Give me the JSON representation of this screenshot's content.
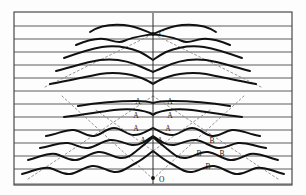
{
  "figure": {
    "type": "wave-record-section",
    "frame": {
      "x": 14,
      "y": 12,
      "width": 278,
      "height": 173,
      "stroke": "#3a3a3a",
      "stroke_width": 1.1
    },
    "axis": {
      "centerline_x": 153,
      "centerline_top_y": 13,
      "centerline_bottom_y": 184,
      "stroke": "#2b2b2b",
      "stroke_width": 1.0
    },
    "point_labels": [
      {
        "name": "C",
        "text": "C",
        "x": 159,
        "y": 36,
        "dot_x": 153,
        "dot_y": 34,
        "dot_r": 1.9
      },
      {
        "name": "O",
        "text": "O",
        "x": 159,
        "y": 182,
        "dot_x": 153,
        "dot_y": 178,
        "dot_r": 1.9
      }
    ],
    "baselines": {
      "count": 13,
      "stroke": "#4a4a4a",
      "stroke_width": 0.9,
      "y_values": [
        26,
        39,
        52,
        65,
        78,
        91,
        104,
        117,
        130,
        143,
        156,
        169,
        184
      ]
    },
    "traces": {
      "stroke": "#111111",
      "stroke_width": 2.0,
      "paths": [
        "M 90 32 C 100 25, 112 24, 124 25 C 136 26, 145 31, 153 34 C 161 31, 170 26, 182 25 C 194 24, 206 25, 216 32",
        "M 76 45 C 88 40, 96 38, 104 39 C 112 40, 118 44, 124 41 C 132 37, 142 36, 153 34 C 164 36, 174 37, 182 41 C 188 44, 194 40, 202 39 C 210 38, 218 40, 230 45",
        "M 64 58 C 78 53, 90 49, 102 47 C 116 45, 128 47, 140 52 C 146 55, 150 58, 153 60 C 156 58, 160 55, 166 52 C 178 47, 190 45, 204 47 C 216 49, 228 53, 242 58",
        "M 56 71 C 72 67, 86 62, 100 60 C 116 58, 132 62, 144 68 C 148 70, 151 71, 153 72 C 155 71, 158 70, 162 68 C 174 62, 190 58, 206 60 C 220 62, 234 67, 250 71",
        "M 50 84 C 68 81, 84 77, 100 74 C 118 71, 136 75, 146 80 C 150 82, 152 83, 153 84 C 154 83, 156 82, 160 80 C 170 75, 188 71, 206 74 C 222 77, 238 81, 256 84",
        "M 64 117 C 82 115, 98 112, 114 110 C 130 108, 142 110, 150 113 C 152 114, 153 115, 153 115 C 153 115, 154 114, 156 113 C 164 110, 176 108, 192 110 C 208 112, 224 115, 242 117",
        "M 46 136 C 58 134, 66 129, 74 130 C 82 131, 86 137, 94 136 C 102 135, 106 128, 114 128 C 122 128, 126 135, 134 135 C 142 135, 148 130, 153 128 C 158 130, 164 135, 172 135 C 180 135, 184 128, 192 128 C 200 128, 204 135, 212 136 C 220 137, 224 131, 232 130 C 240 129, 248 134, 260 136",
        "M 40 148 C 52 146, 60 142, 68 143 C 76 144, 80 149, 88 148 C 96 147, 102 141, 110 140 C 118 139, 124 144, 132 145 C 140 146, 147 140, 153 136 C 159 140, 166 146, 174 145 C 182 144, 188 139, 196 140 C 204 141, 210 147, 218 148 C 226 149, 230 144, 238 143 C 246 142, 254 146, 266 148",
        "M 28 160 C 40 157, 48 152, 56 154 C 64 156, 68 161, 76 160 C 84 159, 90 153, 98 152 C 106 151, 112 157, 120 158 C 128 159, 134 153, 140 148 C 145 144, 150 140, 153 137 C 156 140, 161 144, 166 148 C 172 153, 178 159, 186 158 C 194 157, 200 151, 208 152 C 216 153, 222 159, 230 160 C 238 161, 242 156, 250 154 C 258 152, 266 157, 278 160",
        "M 22 174 C 34 171, 42 166, 50 168 C 58 170, 62 175, 70 174 C 78 173, 84 167, 92 166 C 100 165, 106 171, 114 172 C 122 173, 128 167, 136 163 C 142 160, 148 155, 153 151 C 158 155, 164 160, 170 163 C 178 167, 184 173, 192 172 C 200 171, 206 165, 214 166 C 222 167, 228 173, 236 174 C 244 175, 248 170, 256 168 C 264 166, 272 171, 284 174"
      ],
      "short_trace": "M 78 106 C 96 103, 116 101, 136 101 C 146 101, 150 102, 153 103 C 156 102, 162 101, 172 101 C 192 101, 212 103, 230 106"
    },
    "dashed_lines": {
      "stroke": "#8a8a8a",
      "stroke_width": 0.9,
      "dash_pattern": "2,2.5",
      "segments": [
        {
          "name": "left-upper-diagonal",
          "x1": 45,
          "y1": 87,
          "x2": 153,
          "y2": 34
        },
        {
          "name": "right-upper-diagonal",
          "x1": 261,
          "y1": 87,
          "x2": 153,
          "y2": 34
        },
        {
          "name": "left-lower-diagonal",
          "x1": 28,
          "y1": 179,
          "x2": 153,
          "y2": 96
        },
        {
          "name": "right-lower-diagonal",
          "x1": 278,
          "y1": 179,
          "x2": 153,
          "y2": 96
        },
        {
          "name": "left-cross-diagonal",
          "x1": 62,
          "y1": 96,
          "x2": 153,
          "y2": 179
        },
        {
          "name": "right-cross-diagonal",
          "x1": 244,
          "y1": 96,
          "x2": 153,
          "y2": 179
        },
        {
          "name": "left-inner-cross",
          "x1": 96,
          "y1": 110,
          "x2": 153,
          "y2": 151
        },
        {
          "name": "right-inner-cross",
          "x1": 210,
          "y1": 110,
          "x2": 153,
          "y2": 151
        }
      ]
    },
    "phase_labels": {
      "font_size": 7.5,
      "color": "#1a1a1a",
      "items": [
        {
          "text": "A",
          "x": 138,
          "y": 104
        },
        {
          "text": "A",
          "x": 170,
          "y": 104
        },
        {
          "text": "A",
          "x": 136,
          "y": 118
        },
        {
          "text": "A",
          "x": 170,
          "y": 118
        },
        {
          "text": "A",
          "x": 136,
          "y": 131
        },
        {
          "text": "A",
          "x": 168,
          "y": 131
        },
        {
          "text": "A",
          "x": 143,
          "y": 143
        },
        {
          "text": "A",
          "x": 160,
          "y": 143
        },
        {
          "text": "B",
          "x": 212,
          "y": 143
        },
        {
          "text": "B",
          "x": 199,
          "y": 156
        },
        {
          "text": "B",
          "x": 222,
          "y": 156
        },
        {
          "text": "B",
          "x": 208,
          "y": 169
        }
      ]
    }
  },
  "chart_data": {
    "type": "line",
    "title": "",
    "xlabel": "",
    "ylabel": "",
    "categories": [
      "baseline-1",
      "baseline-2",
      "baseline-3",
      "baseline-4",
      "baseline-5",
      "baseline-6",
      "baseline-7",
      "baseline-8",
      "baseline-9",
      "baseline-10",
      "baseline-11",
      "baseline-12",
      "baseline-13"
    ],
    "values": [
      26,
      39,
      52,
      65,
      78,
      91,
      104,
      117,
      130,
      143,
      156,
      169,
      184
    ],
    "annotations": [
      "C",
      "O",
      "A",
      "A",
      "A",
      "A",
      "A",
      "A",
      "A",
      "A",
      "B",
      "B",
      "B",
      "B"
    ],
    "grid": true,
    "legend_position": "none"
  }
}
